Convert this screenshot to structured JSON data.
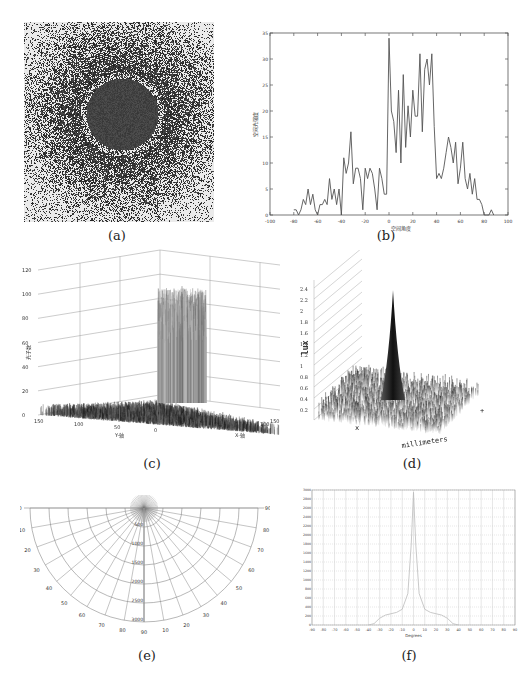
{
  "panels": {
    "a": {
      "caption": "(a)"
    },
    "b": {
      "caption": "(b)"
    },
    "c": {
      "caption": "(c)"
    },
    "d": {
      "caption": "(d)"
    },
    "e": {
      "caption": "(e)"
    },
    "f": {
      "caption": "(f)"
    }
  },
  "chart_data": [
    {
      "id": "a",
      "type": "heatmap",
      "title": "",
      "description": "Speckle/noise intensity image with dark circular central disk and darker surrounding halo fading outward"
    },
    {
      "id": "b",
      "type": "line",
      "title": "",
      "xlabel": "空间角度",
      "ylabel": "空间光强度",
      "xlim": [
        -100,
        100
      ],
      "ylim": [
        0,
        35
      ],
      "xticks": [
        -100,
        -80,
        -60,
        -40,
        -20,
        0,
        20,
        40,
        60,
        80,
        100
      ],
      "yticks": [
        0,
        5,
        10,
        15,
        20,
        25,
        30,
        35
      ],
      "x": [
        -80,
        -78,
        -76,
        -74,
        -72,
        -70,
        -68,
        -66,
        -64,
        -62,
        -60,
        -58,
        -56,
        -54,
        -52,
        -50,
        -48,
        -46,
        -44,
        -42,
        -40,
        -38,
        -36,
        -34,
        -32,
        -30,
        -28,
        -26,
        -24,
        -22,
        -20,
        -18,
        -16,
        -14,
        -12,
        -10,
        -8,
        -6,
        -4,
        -2,
        0,
        2,
        4,
        6,
        8,
        10,
        12,
        14,
        16,
        18,
        20,
        22,
        24,
        26,
        28,
        30,
        32,
        34,
        36,
        38,
        40,
        42,
        44,
        46,
        48,
        50,
        52,
        54,
        56,
        58,
        60,
        62,
        64,
        66,
        68,
        70,
        72,
        74,
        76,
        78,
        80,
        82,
        84,
        86,
        88
      ],
      "values": [
        1,
        1,
        0,
        1,
        3,
        2,
        5,
        2,
        4,
        1,
        0,
        2,
        2,
        3,
        2,
        7,
        3,
        5,
        2,
        5,
        0,
        11,
        8,
        10,
        16,
        6,
        9,
        9,
        7,
        1,
        9,
        7,
        9,
        8,
        5,
        1,
        9,
        7,
        4,
        4,
        34,
        20,
        18,
        12,
        24,
        10,
        27,
        13,
        21,
        15,
        24,
        19,
        19,
        31,
        16,
        28,
        30,
        25,
        31,
        17,
        7,
        8,
        7,
        9,
        12,
        15,
        13,
        10,
        14,
        6,
        9,
        14,
        7,
        5,
        8,
        4,
        7,
        3,
        3,
        2,
        0,
        0,
        0,
        1,
        0
      ],
      "grid": false
    },
    {
      "id": "c",
      "type": "surface3d",
      "zlabel": "光子数",
      "xlabel": "X-轴",
      "ylabel": "Y-轴",
      "zlim": [
        0,
        120
      ],
      "zticks": [
        0,
        20,
        40,
        60,
        80,
        100,
        120
      ],
      "yticks": [
        150,
        100,
        50,
        0
      ],
      "xticks": [
        0,
        50,
        100,
        150
      ],
      "description": "Noisy 3D surface with central plateau ~60 and peak ~100, low noisy floor"
    },
    {
      "id": "d",
      "type": "surface3d",
      "zlabel": "lux",
      "xlabel": "x",
      "ylabel": "millimeters",
      "zticks": [
        0.2,
        0.4,
        0.6,
        0.8,
        1,
        1.2,
        1.4,
        1.6,
        1.8,
        2,
        2.2,
        2.4
      ],
      "description": "Shaded 3D surface with a sharp central spike and bumpy background"
    },
    {
      "id": "e",
      "type": "polar",
      "angle_labels_left": [
        90,
        80,
        70,
        60,
        50,
        40,
        30,
        20,
        10,
        0
      ],
      "angle_labels_right": [
        90,
        80,
        70,
        60,
        50,
        40,
        30,
        20,
        10
      ],
      "radial_labels": [
        500,
        1000,
        1500,
        2000,
        2500,
        3000
      ],
      "description": "Lower half-plane polar grid; intensity lobe concentrated along 0 degrees"
    },
    {
      "id": "f",
      "type": "line",
      "xlabel": "Degrees",
      "ylabel": "",
      "xlim": [
        -90,
        90
      ],
      "ylim": [
        0,
        3000
      ],
      "xticks": [
        -90,
        -80,
        -70,
        -60,
        -50,
        -40,
        -30,
        -20,
        -10,
        0,
        10,
        20,
        30,
        40,
        50,
        60,
        70,
        80,
        90
      ],
      "yticks": [
        0,
        200,
        400,
        600,
        800,
        1000,
        1200,
        1400,
        1600,
        1800,
        2000,
        2200,
        2400,
        2600,
        2800,
        3000
      ],
      "x": [
        -40,
        -35,
        -30,
        -25,
        -20,
        -15,
        -10,
        -5,
        -2,
        0,
        2,
        5,
        10,
        15,
        20,
        25,
        30,
        35,
        40
      ],
      "values": [
        0,
        30,
        150,
        220,
        250,
        280,
        350,
        700,
        1800,
        2950,
        1800,
        700,
        350,
        280,
        250,
        220,
        150,
        30,
        0
      ],
      "grid": true
    }
  ]
}
